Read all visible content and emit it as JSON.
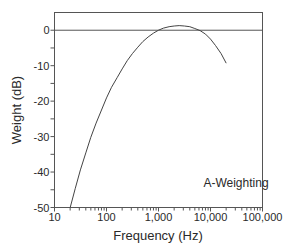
{
  "chart_data": {
    "type": "line",
    "title": "",
    "xlabel": "Frequency (Hz)",
    "ylabel": "Weight (dB)",
    "xscale": "log",
    "xlim": [
      10,
      100000
    ],
    "ylim": [
      -50,
      5
    ],
    "grid": false,
    "reference_line": {
      "y": 0
    },
    "x_ticks": [
      10,
      100,
      1000,
      10000,
      100000
    ],
    "x_tick_labels": [
      "10",
      "100",
      "1,000",
      "10,000",
      "100,000"
    ],
    "y_ticks": [
      0,
      -10,
      -20,
      -30,
      -40,
      -50
    ],
    "y_tick_labels": [
      "0",
      "-10",
      "-20",
      "-30",
      "-40",
      "-50"
    ],
    "annotations": [
      {
        "text": "A-Weighting",
        "x": 3000,
        "y": -43
      }
    ],
    "legend": null,
    "series": [
      {
        "name": "A-Weighting",
        "x": [
          20,
          25,
          31.5,
          40,
          50,
          63,
          80,
          100,
          125,
          160,
          200,
          250,
          315,
          400,
          500,
          630,
          800,
          1000,
          1250,
          1600,
          2000,
          2500,
          3150,
          4000,
          5000,
          6300,
          8000,
          10000,
          12500,
          16000,
          20000
        ],
        "values": [
          -50.5,
          -44.7,
          -39.4,
          -34.6,
          -30.2,
          -26.2,
          -22.5,
          -19.1,
          -16.1,
          -13.4,
          -10.9,
          -8.6,
          -6.6,
          -4.8,
          -3.2,
          -1.9,
          -0.8,
          0.0,
          0.6,
          1.0,
          1.2,
          1.3,
          1.2,
          1.0,
          0.5,
          -0.1,
          -1.1,
          -2.5,
          -4.3,
          -6.6,
          -9.3
        ]
      }
    ]
  },
  "colors": {
    "axis": "#555555",
    "curve": "#444444",
    "text": "#2a2a2a",
    "background": "#ffffff"
  }
}
